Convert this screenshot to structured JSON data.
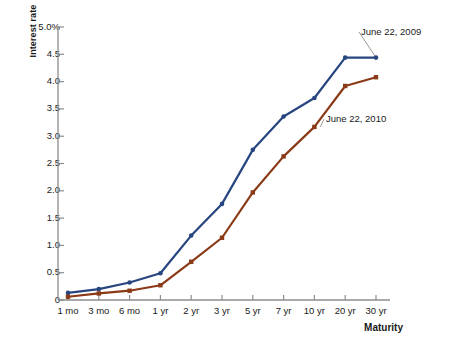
{
  "chart_data": {
    "type": "line",
    "title": "",
    "xlabel": "Maturity",
    "ylabel": "Interest rate",
    "categories": [
      "1 mo",
      "3 mo",
      "6 mo",
      "1 yr",
      "2 yr",
      "3 yr",
      "5 yr",
      "7 yr",
      "10 yr",
      "20 yr",
      "30 yr"
    ],
    "ylim": [
      0,
      5.0
    ],
    "ytick_labels": [
      "0",
      "0.5",
      "1.0",
      "1.5",
      "2.0",
      "2.5",
      "3.0",
      "3.5",
      "4.0",
      "4.5",
      "5.0%"
    ],
    "ytick_values": [
      0,
      0.5,
      1.0,
      1.5,
      2.0,
      2.5,
      3.0,
      3.5,
      4.0,
      4.5,
      5.0
    ],
    "grid": false,
    "legend_position": "inline-annotations",
    "series": [
      {
        "name": "June 22, 2009",
        "color": "#27457f",
        "values": [
          0.13,
          0.2,
          0.32,
          0.49,
          1.18,
          1.76,
          2.75,
          3.36,
          3.7,
          4.44,
          4.44
        ]
      },
      {
        "name": "June 22, 2010",
        "color": "#8a3a17",
        "values": [
          0.06,
          0.12,
          0.17,
          0.27,
          0.7,
          1.14,
          1.97,
          2.63,
          3.17,
          3.92,
          4.08
        ]
      }
    ],
    "annotations": [
      {
        "label": "June 22, 2009",
        "target_category": "30 yr",
        "target_value": 4.44
      },
      {
        "label": "June 22, 2010",
        "target_category": "10 yr",
        "target_value": 3.17
      }
    ]
  },
  "axis": {
    "y_axis_name": "interest-rate-axis",
    "x_axis_name": "maturity-axis"
  }
}
